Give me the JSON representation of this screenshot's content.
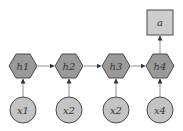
{
  "diagram": {
    "title": "",
    "colors": {
      "hidden_fill": "#9a9a9a",
      "input_fill": "#c4c4c4",
      "output_fill": "#cdcdcd",
      "stroke": "#4a4a4a",
      "edge": "#777777"
    },
    "hidden_nodes": [
      {
        "id": "h1",
        "label": "h1"
      },
      {
        "id": "h2",
        "label": "h2"
      },
      {
        "id": "h3",
        "label": "h3"
      },
      {
        "id": "h4",
        "label": "h4"
      }
    ],
    "input_nodes": [
      {
        "id": "x1",
        "label": "x1"
      },
      {
        "id": "x2a",
        "label": "x2"
      },
      {
        "id": "x2b",
        "label": "x2"
      },
      {
        "id": "x4",
        "label": "x4"
      }
    ],
    "output_node": {
      "id": "a",
      "label": "a"
    },
    "edges": [
      {
        "from": "x1",
        "to": "h1"
      },
      {
        "from": "x2a",
        "to": "h2"
      },
      {
        "from": "x2b",
        "to": "h3"
      },
      {
        "from": "x4",
        "to": "h4"
      },
      {
        "from": "h1",
        "to": "h2"
      },
      {
        "from": "h2",
        "to": "h3"
      },
      {
        "from": "h3",
        "to": "h4"
      },
      {
        "from": "h4",
        "to": "a"
      }
    ]
  }
}
